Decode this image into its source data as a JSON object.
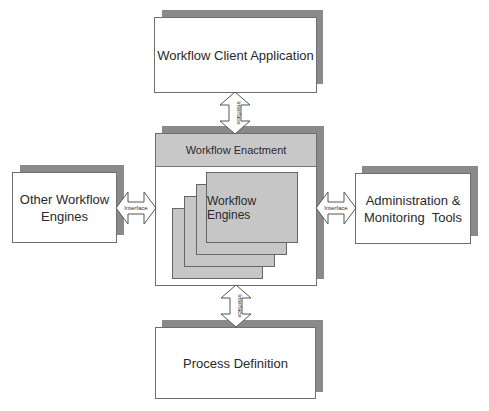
{
  "diagram": {
    "nodes": {
      "client": {
        "label": "Workflow Client Application"
      },
      "enactment": {
        "header": "Workflow Enactment",
        "engines_label": "Workflow Engines"
      },
      "other_engines": {
        "label_line1": "Other Workflow",
        "label_line2": "Engines"
      },
      "admin": {
        "label_line1": "Administration &",
        "label_line2": "Monitoring  Tools"
      },
      "process": {
        "label": "Process Definition"
      }
    },
    "interfaces": {
      "top": "Interface",
      "left": "Interface",
      "right": "Interface",
      "bottom": "Interface"
    },
    "colors": {
      "shadow": "#8a8a8a",
      "header_fill": "#c8c8c8",
      "engine_fill": "#c6c6c6",
      "border": "#6e6e6e"
    }
  }
}
